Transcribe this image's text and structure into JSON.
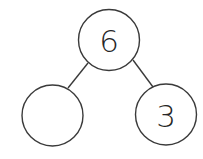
{
  "diagram": {
    "type": "number-bond",
    "stroke_color": "#3a3a3a",
    "text_color": "#262626",
    "whole": {
      "label": "6"
    },
    "parts": [
      {
        "label": ""
      },
      {
        "label": "3"
      }
    ]
  }
}
